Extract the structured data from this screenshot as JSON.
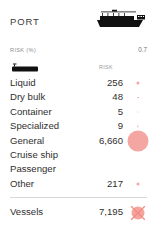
{
  "header": {
    "title": "PORT",
    "ship_icon": "cargo-ship-icon"
  },
  "risk_percent": {
    "label": "RISK (%)",
    "value": "0.7"
  },
  "table": {
    "category_icon": "vessel-silhouette-icon",
    "risk_column_header": "RISK",
    "rows": [
      {
        "label": "Liquid",
        "value": "256",
        "bubble_px": 3.2
      },
      {
        "label": "Dry bulk",
        "value": "48",
        "bubble_px": 1.8
      },
      {
        "label": "Container",
        "value": "5",
        "bubble_px": 1.2
      },
      {
        "label": "Specialized",
        "value": "9",
        "bubble_px": 1.3
      },
      {
        "label": "General",
        "value": "6,660",
        "bubble_px": 21
      },
      {
        "label": "Cruise ship",
        "value": "",
        "bubble_px": 0
      },
      {
        "label": "Passenger",
        "value": "",
        "bubble_px": 0
      },
      {
        "label": "Other",
        "value": "217",
        "bubble_px": 3.0
      }
    ],
    "total": {
      "label": "Vessels",
      "value": "7,195",
      "marker": "cross-marker-icon"
    }
  },
  "colors": {
    "bubble": "#f3a09a",
    "text": "#2f2f2f",
    "muted": "#8d8d8d",
    "divider": "#d8d8d8",
    "background": "#ffffff"
  }
}
